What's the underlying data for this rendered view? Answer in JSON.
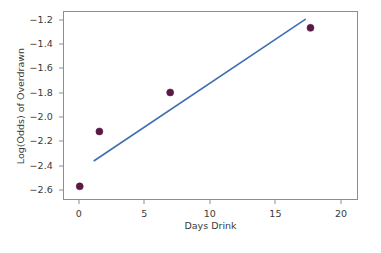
{
  "chart_data": {
    "type": "scatter",
    "title": "",
    "xlabel": "Days Drink",
    "ylabel": "Log(Odds) of Overdrawn",
    "xlim": [
      -1.2,
      21.3
    ],
    "ylim": [
      -2.68,
      -1.13
    ],
    "grid": false,
    "legend": null,
    "xticks": [
      0,
      5,
      10,
      15,
      20
    ],
    "xticklabels": [
      "0",
      "5",
      "10",
      "15",
      "20"
    ],
    "yticks": [
      -1.2,
      -1.4,
      -1.6,
      -1.8,
      -2.0,
      -2.2,
      -2.4,
      -2.6
    ],
    "yticklabels": [
      "−1.2",
      "−1.4",
      "−1.6",
      "−1.8",
      "−2.0",
      "−2.2",
      "−2.4",
      "−2.6"
    ],
    "series": [
      {
        "name": "observed",
        "type": "scatter",
        "marker": "circle",
        "marker_size": 7,
        "color": "#5B1A46",
        "points": [
          {
            "x": 0.0,
            "y": -2.56
          },
          {
            "x": 1.5,
            "y": -2.11
          },
          {
            "x": 6.9,
            "y": -1.79
          },
          {
            "x": 17.6,
            "y": -1.26
          }
        ]
      },
      {
        "name": "fitted-line",
        "type": "line",
        "color": "#3D6FB5",
        "line_width": 1.6,
        "points": [
          {
            "x": 1.1,
            "y": -2.35
          },
          {
            "x": 17.2,
            "y": -1.19
          }
        ]
      }
    ]
  },
  "axes": {
    "frame_color": "#8d8d8d",
    "background": "#ffffff"
  },
  "colors": {
    "marker": "#5B1A46",
    "line": "#3D6FB5",
    "frame": "#8d8d8d",
    "text": "#3a3a3a"
  }
}
